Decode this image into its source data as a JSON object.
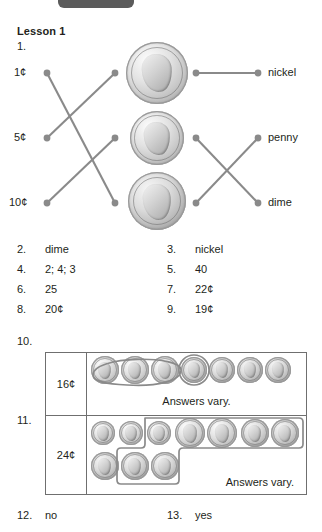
{
  "page": {
    "title": "Lesson 1",
    "top_tab": "dark-rounded-tab"
  },
  "question1": {
    "number": "1.",
    "left_labels": [
      "1¢",
      "5¢",
      "10¢"
    ],
    "right_labels": [
      "nickel",
      "penny",
      "dime"
    ],
    "center_coins": [
      "nickel",
      "dime",
      "penny"
    ],
    "left_connections": [
      {
        "from": "1¢",
        "to_row": 3
      },
      {
        "from": "5¢",
        "to_row": 1
      },
      {
        "from": "10¢",
        "to_row": 2
      }
    ],
    "right_connections": [
      {
        "from_row": 1,
        "to": "nickel"
      },
      {
        "from_row": 2,
        "to": "dime"
      },
      {
        "from_row": 3,
        "to": "penny"
      }
    ]
  },
  "answers": [
    {
      "number": "2.",
      "value": "dime"
    },
    {
      "number": "3.",
      "value": "nickel"
    },
    {
      "number": "4.",
      "value": "2; 4; 3"
    },
    {
      "number": "5.",
      "value": "40"
    },
    {
      "number": "6.",
      "value": "25"
    },
    {
      "number": "7.",
      "value": "22¢"
    },
    {
      "number": "8.",
      "value": "20¢"
    },
    {
      "number": "9.",
      "value": "19¢"
    }
  ],
  "table": {
    "row10": {
      "number": "10.",
      "amount": "16¢",
      "coins": [
        "nickel",
        "nickel",
        "nickel",
        "penny",
        "penny",
        "penny",
        "penny"
      ],
      "note": "Answers vary."
    },
    "row11": {
      "number": "11.",
      "amount": "24¢",
      "coins_top": [
        "dime",
        "dime",
        "dime",
        "nickel",
        "nickel",
        "penny",
        "penny"
      ],
      "coins_bottom": [
        "penny",
        "penny",
        "penny"
      ],
      "note": "Answers vary."
    }
  },
  "footer": [
    {
      "number": "12.",
      "value": "no"
    },
    {
      "number": "13.",
      "value": "yes"
    }
  ],
  "colors": {
    "line": "#8a8a8a",
    "border": "#6f6f6f",
    "text": "#231f20",
    "tab": "#5b5b5b"
  }
}
